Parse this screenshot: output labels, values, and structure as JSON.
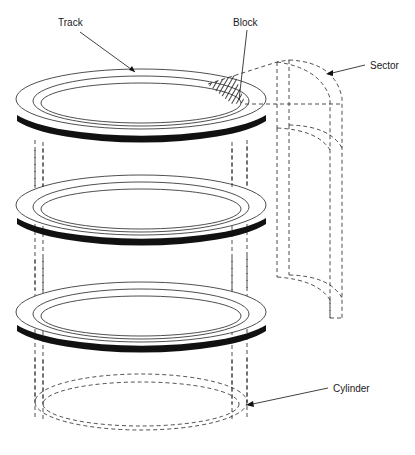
{
  "diagram": {
    "type": "disk-geometry-illustration",
    "labels": {
      "track": "Track",
      "block": "Block",
      "sector": "Sector",
      "cylinder": "Cylinder"
    },
    "platter_count": 3,
    "colors": {
      "line": "#222222",
      "edge": "#111111",
      "background": "#ffffff"
    }
  }
}
